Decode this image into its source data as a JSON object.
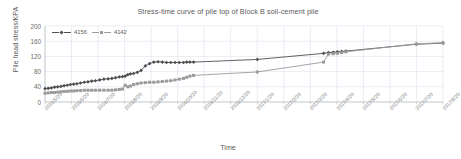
{
  "chart_data": {
    "type": "line",
    "title": "Stress-time curve of pile top of Block B soil-cement pile",
    "xlabel": "Time",
    "ylabel": "Pile head stress/KPA",
    "ylim": [
      0,
      200
    ],
    "yticks": [
      0,
      40,
      80,
      120,
      160,
      200
    ],
    "grid": true,
    "legend_position": "top-left",
    "colors": {
      "series_4156": "#4f4f4f",
      "series_4142": "#9b9b9b",
      "grid": "#d9e2ec",
      "text": "#5a5a5a"
    },
    "categories": [
      "2016/5/20",
      "2016/6/20",
      "2016/7/20",
      "2016/8/20",
      "2016/9/20",
      "2016/10/20",
      "2016/11/20",
      "2016/12/20",
      "2017/1/20",
      "2017/2/20",
      "2017/3/20",
      "2017/4/20",
      "2017/5/20",
      "2017/6/20",
      "2017/7/20",
      "2017/8/20"
    ],
    "series": [
      {
        "name": "4156",
        "marker": "diamond",
        "x": [
          0.0,
          0.12,
          0.24,
          0.36,
          0.48,
          0.6,
          0.72,
          0.84,
          0.96,
          1.08,
          1.2,
          1.34,
          1.48,
          1.62,
          1.76,
          1.9,
          2.06,
          2.22,
          2.38,
          2.52,
          2.66,
          2.8,
          2.92,
          3.02,
          3.12,
          3.22,
          3.34,
          3.48,
          3.62,
          3.78,
          3.94,
          4.1,
          4.26,
          4.42,
          4.58,
          4.74,
          4.9,
          5.06,
          5.22,
          5.34,
          5.46,
          5.6,
          8.0,
          10.5,
          10.68,
          10.86,
          11.02,
          11.18,
          11.34,
          14.0,
          15.0
        ],
        "y": [
          35,
          36,
          37,
          39,
          40,
          41,
          43,
          44,
          46,
          47,
          48,
          50,
          52,
          53,
          55,
          56,
          58,
          60,
          61,
          62,
          64,
          66,
          67,
          68,
          72,
          74,
          75,
          78,
          83,
          95,
          101,
          105,
          106,
          105,
          104,
          104,
          104,
          104,
          104,
          105,
          105,
          105,
          112,
          128,
          130,
          131,
          132,
          133,
          134,
          152,
          155
        ]
      },
      {
        "name": "4142",
        "marker": "square",
        "x": [
          0.0,
          0.12,
          0.24,
          0.36,
          0.48,
          0.6,
          0.72,
          0.84,
          0.96,
          1.08,
          1.2,
          1.34,
          1.48,
          1.62,
          1.76,
          1.9,
          2.06,
          2.22,
          2.38,
          2.52,
          2.66,
          2.8,
          2.92,
          3.02,
          3.12,
          3.22,
          3.34,
          3.48,
          3.62,
          3.78,
          3.94,
          4.1,
          4.26,
          4.42,
          4.58,
          4.74,
          4.9,
          5.06,
          5.22,
          5.34,
          5.46,
          5.6,
          8.0,
          10.5,
          10.68,
          10.86,
          11.02,
          11.18,
          11.34,
          14.0,
          15.0
        ],
        "y": [
          23,
          24,
          25,
          25,
          26,
          27,
          28,
          28,
          29,
          29,
          30,
          30,
          31,
          31,
          31,
          31,
          31,
          31,
          31,
          31,
          32,
          33,
          34,
          44,
          40,
          42,
          46,
          48,
          50,
          51,
          52,
          52,
          53,
          54,
          55,
          56,
          58,
          60,
          62,
          65,
          68,
          70,
          79,
          105,
          126,
          127,
          128,
          130,
          132,
          153,
          156
        ]
      }
    ]
  },
  "legend": {
    "items": [
      {
        "label": "4156"
      },
      {
        "label": "4142"
      }
    ]
  }
}
